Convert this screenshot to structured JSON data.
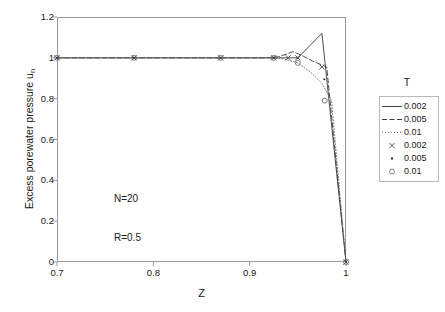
{
  "chart_data": {
    "type": "line",
    "title": "",
    "xlabel": "Z",
    "ylabel": "Excess porewater pressure u",
    "ylabel_sub": "n",
    "xlim": [
      0.7,
      1.0
    ],
    "ylim": [
      0.0,
      1.2
    ],
    "xticks": [
      "0.7",
      "0.8",
      "0.9",
      "1"
    ],
    "xtick_values": [
      0.7,
      0.8,
      0.9,
      1.0
    ],
    "yticks": [
      "0",
      "0.2",
      "0.4",
      "0.6",
      "0.8",
      "1",
      "1.2"
    ],
    "ytick_values": [
      0,
      0.2,
      0.4,
      0.6,
      0.8,
      1.0,
      1.2
    ],
    "grid": false,
    "legend_position": "right",
    "legend_title": "T",
    "annotations": [
      "N=20",
      "R=0.5"
    ],
    "series": [
      {
        "name": "0.002",
        "style": "solid",
        "marker": "none",
        "color": "#3b3b3b",
        "x": [
          0.7,
          0.78,
          0.87,
          0.925,
          0.94,
          0.95,
          0.975,
          1.0
        ],
        "y": [
          1.0,
          1.0,
          1.0,
          1.0,
          1.0,
          1.0,
          1.12,
          0.0
        ]
      },
      {
        "name": "0.005",
        "style": "dashed",
        "marker": "none",
        "color": "#3b3b3b",
        "x": [
          0.7,
          0.78,
          0.87,
          0.915,
          0.93,
          0.945,
          0.955,
          0.965,
          0.98,
          1.0
        ],
        "y": [
          1.0,
          1.0,
          1.0,
          1.0,
          1.005,
          1.03,
          1.01,
          0.985,
          0.955,
          0.0
        ]
      },
      {
        "name": "0.01",
        "style": "dotted",
        "marker": "none",
        "color": "#6d6d6d",
        "x": [
          0.7,
          0.78,
          0.87,
          0.915,
          0.935,
          0.95,
          0.962,
          0.975,
          0.985,
          1.0
        ],
        "y": [
          1.0,
          1.0,
          1.0,
          1.0,
          0.995,
          0.975,
          0.935,
          0.875,
          0.79,
          0.0
        ]
      },
      {
        "name": "0.002",
        "style": "none",
        "marker": "x",
        "color": "#3b3b3b",
        "x": [
          0.7,
          0.78,
          0.87,
          0.925,
          0.94,
          0.95,
          0.975,
          1.0
        ],
        "y": [
          1.0,
          1.0,
          1.0,
          1.0,
          1.0,
          1.0,
          0.955,
          0.0
        ]
      },
      {
        "name": "0.005",
        "style": "none",
        "marker": "dot",
        "color": "#3b3b3b",
        "x": [
          0.7,
          0.78,
          0.87,
          0.925,
          0.95,
          0.9775,
          1.0
        ],
        "y": [
          1.0,
          1.0,
          1.0,
          1.0,
          1.0,
          0.895,
          0.0
        ]
      },
      {
        "name": "0.01",
        "style": "none",
        "marker": "circle",
        "color": "#6d6d6d",
        "x": [
          0.7,
          0.78,
          0.87,
          0.925,
          0.95,
          0.978,
          1.0
        ],
        "y": [
          1.0,
          1.0,
          1.0,
          1.0,
          0.975,
          0.79,
          0.0
        ]
      }
    ],
    "legend_entries": [
      {
        "label": "0.002",
        "style": "solid",
        "marker": "none"
      },
      {
        "label": "0.005",
        "style": "dashed",
        "marker": "none"
      },
      {
        "label": "0.01",
        "style": "dotted",
        "marker": "none"
      },
      {
        "label": "0.002",
        "style": "none",
        "marker": "x"
      },
      {
        "label": "0.005",
        "style": "none",
        "marker": "dot"
      },
      {
        "label": "0.01",
        "style": "none",
        "marker": "circle"
      }
    ],
    "colors": {
      "axis": "#9a9a9a",
      "text": "#1a1a1a",
      "line_dark": "#3b3b3b",
      "line_light": "#6d6d6d",
      "legend_border": "#b9b9b9",
      "background": "#ffffff"
    }
  }
}
